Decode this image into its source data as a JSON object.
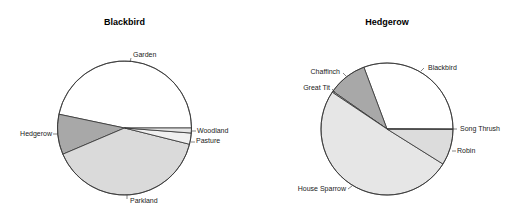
{
  "chart_data": [
    {
      "type": "pie",
      "title": "Blackbird",
      "start_angle_deg": 0,
      "direction": "counterclockwise",
      "labels": [
        "Garden",
        "Hedgerow",
        "Parkland",
        "Pasture",
        "Woodland"
      ],
      "values": [
        46.7,
        9.7,
        39.7,
        2.7,
        1.2
      ],
      "colors": [
        "#ffffff",
        "#a8a8a8",
        "#dadada",
        "#f0f0f0",
        "#e6e6e6"
      ],
      "center": [
        124.5,
        128
      ],
      "radius": 67,
      "title_pos": [
        124.5,
        25
      ],
      "label_positions": [
        [
          133,
          57,
          "start"
        ],
        [
          52,
          136,
          "end"
        ],
        [
          130,
          203,
          "start"
        ],
        [
          196,
          143,
          "start"
        ],
        [
          197,
          133,
          "start"
        ]
      ],
      "tick_lines": [
        [
          131,
          58,
          130,
          62
        ],
        [
          53,
          134,
          58,
          134
        ],
        [
          127,
          199,
          127,
          195
        ],
        [
          191,
          142,
          195,
          142
        ],
        [
          192,
          131,
          196,
          131
        ]
      ]
    },
    {
      "type": "pie",
      "title": "Hedgerow",
      "start_angle_deg": 0,
      "direction": "counterclockwise",
      "labels": [
        "Blackbird",
        "Chaffinch",
        "Great Tit",
        "House Sparrow",
        "Robin",
        "Song Thrush"
      ],
      "values": [
        30.7,
        9.6,
        0.3,
        50.5,
        8.8,
        0.1
      ],
      "colors": [
        "#ffffff",
        "#a8a8a8",
        "#cfcfcf",
        "#e6e6e6",
        "#dcdcdc",
        "#f2f2f2"
      ],
      "center": [
        387,
        129
      ],
      "radius": 66,
      "title_pos": [
        387,
        25
      ],
      "label_positions": [
        [
          428,
          70,
          "start"
        ],
        [
          340,
          74,
          "end"
        ],
        [
          330,
          90,
          "end"
        ],
        [
          346,
          191,
          "end"
        ],
        [
          457,
          153,
          "start"
        ],
        [
          460,
          131,
          "start"
        ]
      ],
      "tick_lines": [
        [
          424,
          68,
          421,
          71
        ],
        [
          343,
          73,
          346,
          76
        ],
        [
          332,
          89,
          335,
          92
        ],
        [
          348,
          189,
          352,
          186
        ],
        [
          452,
          151,
          456,
          151
        ],
        [
          453,
          129,
          457,
          129
        ]
      ]
    }
  ]
}
